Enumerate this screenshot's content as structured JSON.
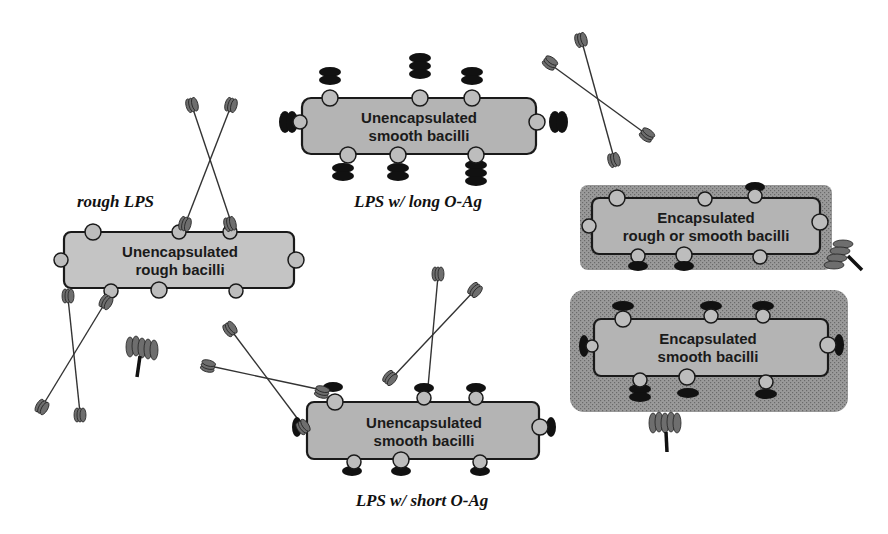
{
  "diagram": {
    "cells": [
      {
        "id": "unencap-smooth-long",
        "line1": "Unencapsulated",
        "line2": "smooth bacilli"
      },
      {
        "id": "unencap-rough",
        "line1": "Unencapsulated",
        "line2": "rough bacilli"
      },
      {
        "id": "unencap-smooth-short",
        "line1": "Unencapsulated",
        "line2": "smooth bacilli"
      },
      {
        "id": "encap-rough-smooth",
        "line1": "Encapsulated",
        "line2": "rough or smooth bacilli"
      },
      {
        "id": "encap-smooth",
        "line1": "Encapsulated",
        "line2": "smooth bacilli"
      }
    ],
    "captions": {
      "long": "LPS w/ long O-Ag",
      "rough": "rough LPS",
      "short": "LPS w/ short O-Ag"
    },
    "colors": {
      "cell_fill": "#b4b4b4",
      "capsule_fill": "#8c8c8c",
      "o_antigen": "#111111",
      "antibody": "#6e6e6e"
    }
  }
}
